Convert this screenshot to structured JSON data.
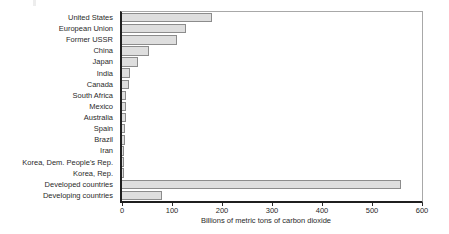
{
  "chart_data": {
    "type": "bar",
    "orientation": "horizontal",
    "title": "",
    "xlabel": "Billions of metric tons of carbon dioxide",
    "ylabel": "",
    "xlim": [
      0,
      600
    ],
    "xticks": [
      0,
      100,
      200,
      300,
      400,
      500,
      600
    ],
    "grid": false,
    "legend": false,
    "categories": [
      "United States",
      "European Union",
      "Former USSR",
      "China",
      "Japan",
      "India",
      "Canada",
      "South Africa",
      "Mexico",
      "Australia",
      "Spain",
      "Brazil",
      "Iran",
      "Korea, Dem. People's Rep.",
      "Korea, Rep.",
      "Developed countries",
      "Developing countries"
    ],
    "values": [
      180,
      127,
      110,
      53,
      32,
      16,
      14,
      8,
      7,
      7,
      6,
      5,
      4,
      4,
      3,
      558,
      80
    ],
    "colors": {
      "bar_fill": "#dedede",
      "bar_border": "#8c8c8c",
      "axis": "#1f1f1f",
      "frame": "#a8a8a8",
      "text": "#2a2a2a",
      "background": "#ffffff"
    }
  }
}
